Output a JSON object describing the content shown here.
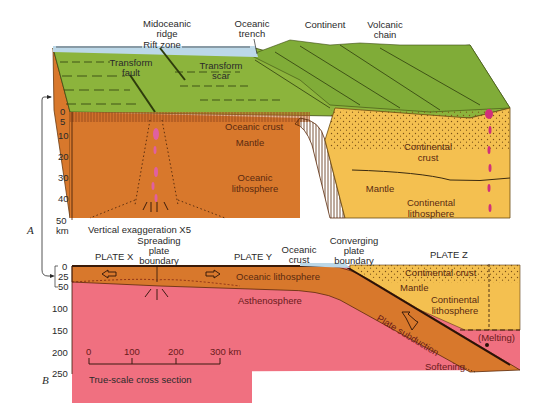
{
  "diagram": {
    "panel_a": {
      "letter": "A",
      "top_labels": {
        "midoceanic_ridge_1": "Midoceanic",
        "midoceanic_ridge_2": "ridge",
        "rift_zone": "Rift zone",
        "oceanic_trench_1": "Oceanic",
        "oceanic_trench_2": "trench",
        "continent": "Continent",
        "volcanic_chain_1": "Volcanic",
        "volcanic_chain_2": "chain",
        "transform_fault_1": "Transform",
        "transform_fault_2": "fault",
        "transform_scar_1": "Transform",
        "transform_scar_2": "scar"
      },
      "layer_labels": {
        "oceanic_crust": "Oceanic crust",
        "mantle": "Mantle",
        "oceanic_lithosphere_1": "Oceanic",
        "oceanic_lithosphere_2": "lithosphere",
        "continental_crust_1": "Continental",
        "continental_crust_2": "crust",
        "mantle_right": "Mantle",
        "continental_lithosphere_1": "Continental",
        "continental_lithosphere_2": "lithosphere"
      },
      "depth_axis": {
        "ticks": [
          "0",
          "5",
          "10",
          "20",
          "30",
          "40",
          "50"
        ],
        "unit": "km"
      },
      "caption": "Vertical exaggeration X5"
    },
    "panel_b": {
      "letter": "B",
      "top_labels": {
        "spreading_1": "Spreading",
        "spreading_2": "plate",
        "spreading_3": "boundary",
        "plate_x": "PLATE X",
        "plate_y": "PLATE Y",
        "oceanic_crust_1": "Oceanic",
        "oceanic_crust_2": "crust",
        "converging_1": "Converging",
        "converging_2": "plate",
        "converging_3": "boundary",
        "plate_z": "PLATE Z"
      },
      "layer_labels": {
        "oceanic_lithosphere": "Oceanic lithosphere",
        "asthenosphere": "Asthenosphere",
        "continental_crust": "Continental crust",
        "mantle": "Mantle",
        "continental_lithosphere_1": "Continental",
        "continental_lithosphere_2": "lithosphere",
        "plate_subduction": "Plate subduction",
        "melting": "(Melting)",
        "softening": "Softening"
      },
      "depth_axis": {
        "ticks": [
          "0",
          "25",
          "50",
          "100",
          "150",
          "200",
          "250"
        ]
      },
      "scale_bar": {
        "ticks": [
          "0",
          "100",
          "200",
          "300 km"
        ]
      },
      "caption": "True-scale cross section"
    },
    "colors": {
      "ocean_water": "#bcd8e8",
      "seafloor_green": "#8cb43c",
      "oceanic_lithosphere": "#d8782c",
      "asthenosphere": "#f07080",
      "continental": "#f4c050",
      "magma": "#d0307a"
    }
  }
}
